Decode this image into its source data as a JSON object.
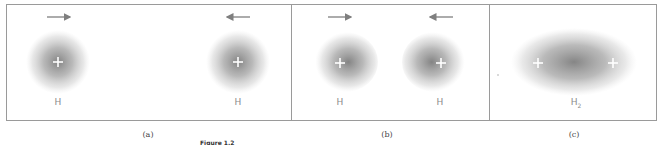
{
  "figure": {
    "panels": [
      {
        "id": "a",
        "caption": "(a)",
        "atoms": [
          {
            "label": "H",
            "nucleus": "+"
          },
          {
            "label": "H",
            "nucleus": "+"
          }
        ],
        "arrows": [
          "right-arrow",
          "left-arrow"
        ]
      },
      {
        "id": "b",
        "caption": "(b)",
        "atoms": [
          {
            "label": "H",
            "nucleus": "+"
          },
          {
            "label": "H",
            "nucleus": "+"
          }
        ],
        "arrows": [
          "right-arrow",
          "left-arrow"
        ]
      },
      {
        "id": "c",
        "caption": "(c)",
        "molecule": {
          "label_main": "H",
          "label_sub": "2",
          "nuclei": [
            "+",
            "+"
          ]
        }
      }
    ],
    "figure_label": "Figure 1.2",
    "colors": {
      "border": "#9a9a9a",
      "cloud": "#7a7a7a",
      "arrow": "#7f7f7f",
      "nucleus": "#ffffff"
    }
  }
}
